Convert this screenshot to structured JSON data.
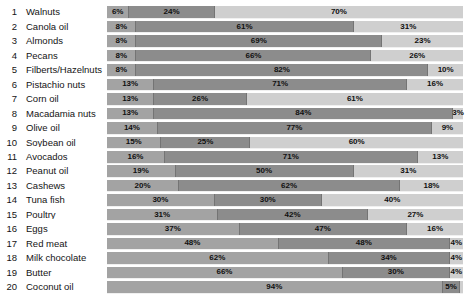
{
  "chart_data": {
    "type": "bar",
    "stacked": true,
    "orientation": "horizontal",
    "unit": "%",
    "title": "",
    "xlabel": "",
    "ylabel": "",
    "xlim": [
      0,
      100
    ],
    "grid": false,
    "legend": "none",
    "colors": {
      "segment1": "#a3a3a3",
      "segment2": "#8c8c8c",
      "segment3": "#cfcfcf",
      "divider": "#747474",
      "text": "#141414"
    },
    "rows": [
      {
        "rank": "1",
        "label": "Walnuts",
        "values": [
          6,
          24,
          70
        ],
        "labels": [
          "6%",
          "24%",
          "70%"
        ]
      },
      {
        "rank": "2",
        "label": "Canola oil",
        "values": [
          8,
          61,
          31
        ],
        "labels": [
          "8%",
          "61%",
          "31%"
        ]
      },
      {
        "rank": "3",
        "label": "Almonds",
        "values": [
          8,
          69,
          23
        ],
        "labels": [
          "8%",
          "69%",
          "23%"
        ]
      },
      {
        "rank": "4",
        "label": "Pecans",
        "values": [
          8,
          66,
          26
        ],
        "labels": [
          "8%",
          "66%",
          "26%"
        ]
      },
      {
        "rank": "5",
        "label": "Filberts/Hazelnuts",
        "values": [
          8,
          82,
          10
        ],
        "labels": [
          "8%",
          "82%",
          "10%"
        ]
      },
      {
        "rank": "6",
        "label": "Pistachio nuts",
        "values": [
          13,
          71,
          16
        ],
        "labels": [
          "13%",
          "71%",
          "16%"
        ]
      },
      {
        "rank": "7",
        "label": "Corn oil",
        "values": [
          13,
          26,
          61
        ],
        "labels": [
          "13%",
          "26%",
          "61%"
        ]
      },
      {
        "rank": "8",
        "label": "Macadamia nuts",
        "values": [
          13,
          84,
          3
        ],
        "labels": [
          "13%",
          "84%",
          "3%"
        ]
      },
      {
        "rank": "9",
        "label": "Olive oil",
        "values": [
          14,
          77,
          9
        ],
        "labels": [
          "14%",
          "77%",
          "9%"
        ]
      },
      {
        "rank": "10",
        "label": "Soybean oil",
        "values": [
          15,
          25,
          60
        ],
        "labels": [
          "15%",
          "25%",
          "60%"
        ]
      },
      {
        "rank": "11",
        "label": "Avocados",
        "values": [
          16,
          71,
          13
        ],
        "labels": [
          "16%",
          "71%",
          "13%"
        ]
      },
      {
        "rank": "12",
        "label": "Peanut oil",
        "values": [
          19,
          50,
          31
        ],
        "labels": [
          "19%",
          "50%",
          "31%"
        ]
      },
      {
        "rank": "13",
        "label": "Cashews",
        "values": [
          20,
          62,
          18
        ],
        "labels": [
          "20%",
          "62%",
          "18%"
        ]
      },
      {
        "rank": "14",
        "label": "Tuna fish",
        "values": [
          30,
          30,
          40
        ],
        "labels": [
          "30%",
          "30%",
          "40%"
        ]
      },
      {
        "rank": "15",
        "label": "Poultry",
        "values": [
          31,
          42,
          27
        ],
        "labels": [
          "31%",
          "42%",
          "27%"
        ]
      },
      {
        "rank": "16",
        "label": "Eggs",
        "values": [
          37,
          47,
          16
        ],
        "labels": [
          "37%",
          "47%",
          "16%"
        ]
      },
      {
        "rank": "17",
        "label": "Red meat",
        "values": [
          48,
          48,
          4
        ],
        "labels": [
          "48%",
          "48%",
          "4%"
        ]
      },
      {
        "rank": "18",
        "label": "Milk chocolate",
        "values": [
          62,
          34,
          4
        ],
        "labels": [
          "62%",
          "34%",
          "4%"
        ]
      },
      {
        "rank": "19",
        "label": "Butter",
        "values": [
          66,
          30,
          4
        ],
        "labels": [
          "66%",
          "30%",
          "4%"
        ]
      },
      {
        "rank": "20",
        "label": "Coconut oil",
        "values": [
          94,
          5,
          1
        ],
        "labels": [
          "94%",
          "5%",
          ""
        ]
      }
    ]
  }
}
